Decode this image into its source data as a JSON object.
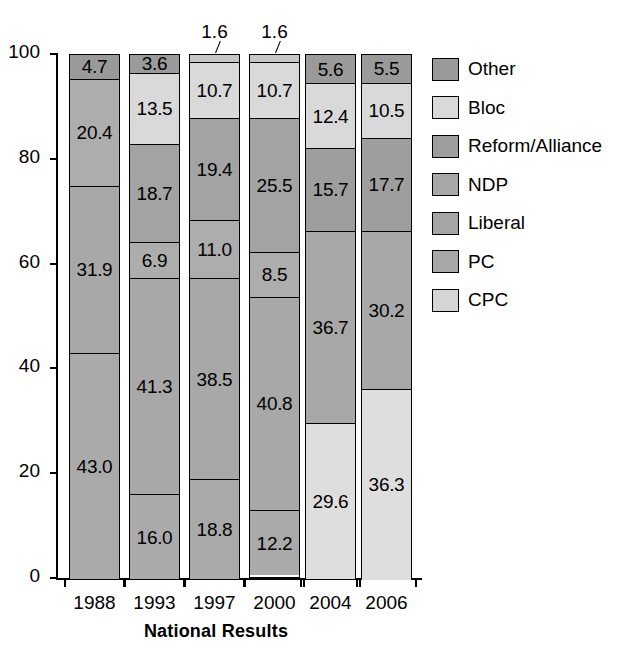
{
  "chart_data": {
    "type": "bar",
    "subtype": "stacked-bar-100",
    "title": "",
    "xlabel": "National Results",
    "ylabel": "",
    "ylim": [
      0,
      100
    ],
    "yticks": [
      0,
      20,
      40,
      60,
      80,
      100
    ],
    "grid": false,
    "legend_position": "right",
    "categories": [
      "1988",
      "1993",
      "1997",
      "2000",
      "2004",
      "2006"
    ],
    "series": [
      {
        "name": "Other",
        "color": "#9a9a9a",
        "values": [
          4.7,
          3.6,
          1.6,
          1.6,
          5.6,
          5.5
        ]
      },
      {
        "name": "Bloc",
        "color": "#d9d9d9",
        "values": [
          null,
          13.5,
          10.7,
          10.7,
          12.4,
          10.5
        ]
      },
      {
        "name": "Reform/Alliance",
        "color": "#a3a3a3",
        "values": [
          null,
          18.7,
          19.4,
          25.5,
          null,
          null
        ]
      },
      {
        "name": "NDP",
        "color": "#adadad",
        "values": [
          20.4,
          6.9,
          11.0,
          8.5,
          15.7,
          17.7
        ]
      },
      {
        "name": "Liberal",
        "color": "#a8a8a8",
        "values": [
          31.9,
          41.3,
          38.5,
          40.8,
          36.7,
          30.2
        ]
      },
      {
        "name": "PC",
        "color": "#aaaaaa",
        "values": [
          43.0,
          16.0,
          18.8,
          12.2,
          null,
          null
        ]
      },
      {
        "name": "CPC",
        "color": "#dedede",
        "values": [
          null,
          null,
          null,
          null,
          29.6,
          36.3
        ]
      }
    ],
    "stacks": [
      {
        "category": "1988",
        "segments": [
          {
            "series": "Other",
            "value": 4.7,
            "label": "4.7",
            "color": "#9a9a9a",
            "callout": false
          },
          {
            "series": "NDP",
            "value": 20.4,
            "label": "20.4",
            "color": "#adadad",
            "callout": false
          },
          {
            "series": "Liberal",
            "value": 31.9,
            "label": "31.9",
            "color": "#a8a8a8",
            "callout": false
          },
          {
            "series": "PC",
            "value": 43.0,
            "label": "43.0",
            "color": "#aaaaaa",
            "callout": false
          }
        ]
      },
      {
        "category": "1993",
        "segments": [
          {
            "series": "Other",
            "value": 3.6,
            "label": "3.6",
            "color": "#9a9a9a",
            "callout": false
          },
          {
            "series": "Bloc",
            "value": 13.5,
            "label": "13.5",
            "color": "#d9d9d9",
            "callout": false
          },
          {
            "series": "Reform/Alliance",
            "value": 18.7,
            "label": "18.7",
            "color": "#a3a3a3",
            "callout": false
          },
          {
            "series": "NDP",
            "value": 6.9,
            "label": "6.9",
            "color": "#adadad",
            "callout": false
          },
          {
            "series": "Liberal",
            "value": 41.3,
            "label": "41.3",
            "color": "#a8a8a8",
            "callout": false
          },
          {
            "series": "PC",
            "value": 16.0,
            "label": "16.0",
            "color": "#aaaaaa",
            "callout": false
          }
        ]
      },
      {
        "category": "1997",
        "segments": [
          {
            "series": "Other",
            "value": 1.6,
            "label": "1.6",
            "color": "#c6c6c6",
            "callout": true
          },
          {
            "series": "Bloc",
            "value": 10.7,
            "label": "10.7",
            "color": "#d9d9d9",
            "callout": false
          },
          {
            "series": "Reform/Alliance",
            "value": 19.4,
            "label": "19.4",
            "color": "#a3a3a3",
            "callout": false
          },
          {
            "series": "NDP",
            "value": 11.0,
            "label": "11.0",
            "color": "#adadad",
            "callout": false
          },
          {
            "series": "Liberal",
            "value": 38.5,
            "label": "38.5",
            "color": "#a8a8a8",
            "callout": false
          },
          {
            "series": "PC",
            "value": 18.8,
            "label": "18.8",
            "color": "#aaaaaa",
            "callout": false
          }
        ]
      },
      {
        "category": "2000",
        "segments": [
          {
            "series": "Other",
            "value": 1.6,
            "label": "1.6",
            "color": "#c6c6c6",
            "callout": true
          },
          {
            "series": "Bloc",
            "value": 10.7,
            "label": "10.7",
            "color": "#d9d9d9",
            "callout": false
          },
          {
            "series": "Reform/Alliance",
            "value": 25.5,
            "label": "25.5",
            "color": "#a3a3a3",
            "callout": false
          },
          {
            "series": "NDP",
            "value": 8.5,
            "label": "8.5",
            "color": "#adadad",
            "callout": false
          },
          {
            "series": "Liberal",
            "value": 40.8,
            "label": "40.8",
            "color": "#a8a8a8",
            "callout": false
          },
          {
            "series": "PC",
            "value": 12.2,
            "label": "12.2",
            "color": "#aaaaaa",
            "callout": false
          }
        ]
      },
      {
        "category": "2004",
        "segments": [
          {
            "series": "Other",
            "value": 5.6,
            "label": "5.6",
            "color": "#9a9a9a",
            "callout": false
          },
          {
            "series": "Bloc",
            "value": 12.4,
            "label": "12.4",
            "color": "#d9d9d9",
            "callout": false
          },
          {
            "series": "NDP",
            "value": 15.7,
            "label": "15.7",
            "color": "#9e9e9e",
            "callout": false
          },
          {
            "series": "Liberal",
            "value": 36.7,
            "label": "36.7",
            "color": "#a8a8a8",
            "callout": false
          },
          {
            "series": "CPC",
            "value": 29.6,
            "label": "29.6",
            "color": "#dedede",
            "callout": false
          }
        ]
      },
      {
        "category": "2006",
        "segments": [
          {
            "series": "Other",
            "value": 5.5,
            "label": "5.5",
            "color": "#9a9a9a",
            "callout": false
          },
          {
            "series": "Bloc",
            "value": 10.5,
            "label": "10.5",
            "color": "#d9d9d9",
            "callout": false
          },
          {
            "series": "NDP",
            "value": 17.7,
            "label": "17.7",
            "color": "#9e9e9e",
            "callout": false
          },
          {
            "series": "Liberal",
            "value": 30.2,
            "label": "30.2",
            "color": "#a8a8a8",
            "callout": false
          },
          {
            "series": "CPC",
            "value": 36.3,
            "label": "36.3",
            "color": "#dedede",
            "callout": false
          }
        ]
      }
    ],
    "legend": [
      {
        "label": "Other",
        "color": "#9a9a9a"
      },
      {
        "label": "Bloc",
        "color": "#d9d9d9"
      },
      {
        "label": "Reform/Alliance",
        "color": "#9e9e9e"
      },
      {
        "label": "NDP",
        "color": "#a8a8a8"
      },
      {
        "label": "Liberal",
        "color": "#a5a5a5"
      },
      {
        "label": "PC",
        "color": "#a8a8a8"
      },
      {
        "label": "CPC",
        "color": "#d5d5d5"
      }
    ]
  }
}
